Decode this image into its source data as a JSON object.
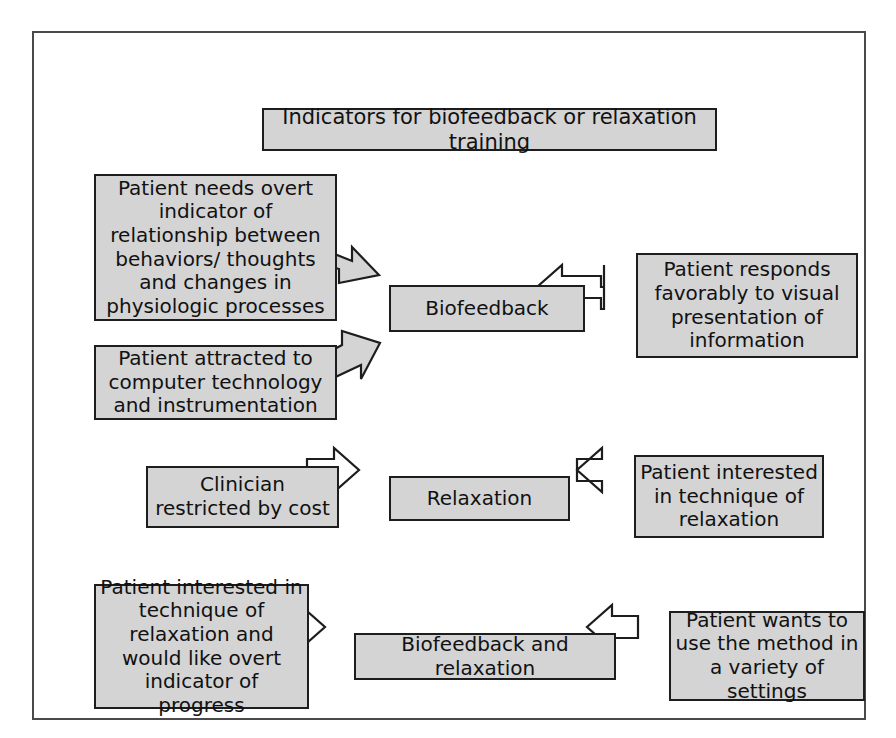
{
  "diagram": {
    "title": "Indicators for biofeedback or relaxation training",
    "nodes": {
      "title_box": "Indicators for biofeedback or relaxation training",
      "need_overt": "Patient needs overt indicator of relationship between behaviors/ thoughts and changes in physiologic processes",
      "attracted": "Patient attracted to computer technology and instrumentation",
      "biofeedback": "Biofeedback",
      "responds": "Patient responds favorably to visual presentation of information",
      "clinician": "Clinician restricted by cost",
      "relaxation": "Relaxation",
      "interested": "Patient interested in technique of relaxation",
      "interested_overt": "Patient interested in technique of relaxation and would like overt indicator of progress",
      "both": "Biofeedback and relaxation",
      "variety": "Patient wants to use the method in a variety of settings"
    },
    "edges": [
      {
        "name": "need-overt-to-biofeedback",
        "from": "need_overt",
        "to": "biofeedback",
        "style": "filled-gray",
        "direction": "right-down"
      },
      {
        "name": "attracted-to-biofeedback",
        "from": "attracted",
        "to": "biofeedback",
        "style": "filled-gray",
        "direction": "right-up"
      },
      {
        "name": "responds-to-biofeedback",
        "from": "responds",
        "to": "biofeedback",
        "style": "outline-white",
        "direction": "left"
      },
      {
        "name": "clinician-to-relaxation",
        "from": "clinician",
        "to": "relaxation",
        "style": "outline-white",
        "direction": "right"
      },
      {
        "name": "interested-to-relaxation",
        "from": "interested",
        "to": "relaxation",
        "style": "outline-white",
        "direction": "left"
      },
      {
        "name": "interested-overt-to-both",
        "from": "interested_overt",
        "to": "both",
        "style": "outline-white",
        "direction": "right"
      },
      {
        "name": "variety-to-both",
        "from": "variety",
        "to": "both",
        "style": "outline-white",
        "direction": "left"
      }
    ],
    "colors": {
      "node_fill": "#d4d4d4",
      "node_border": "#1d1d1d",
      "frame_border": "#4a4a4a",
      "page_background": "#ffffff",
      "arrow_outline_fill": "#ffffff",
      "arrow_filled": "#d4d4d4"
    }
  }
}
